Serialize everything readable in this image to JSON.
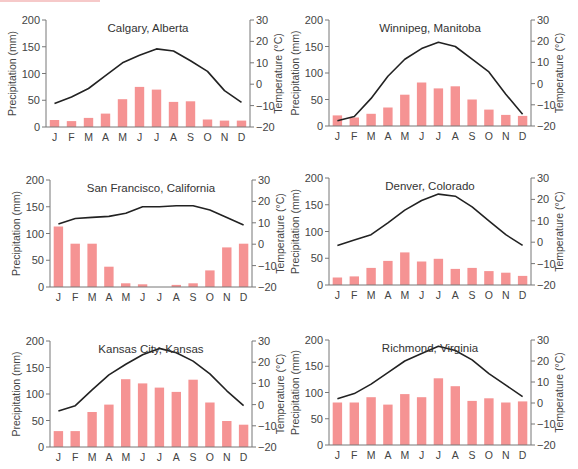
{
  "figure": {
    "left_axis_label": "Precipitation (mm)",
    "right_axis_label": "Temperature (°C)",
    "left_ticks": [
      "0",
      "50",
      "100",
      "150",
      "200"
    ],
    "right_ticks": [
      "-20",
      "-10",
      "0",
      "10",
      "20",
      "30"
    ],
    "months": [
      "J",
      "F",
      "M",
      "A",
      "M",
      "J",
      "J",
      "A",
      "S",
      "O",
      "N",
      "D"
    ],
    "bar_color": "#f59393",
    "line_color": "#222222",
    "axis_color": "#777777"
  },
  "chart_data": [
    {
      "type": "bar+line",
      "title": "Calgary, Alberta",
      "categories": [
        "J",
        "F",
        "M",
        "A",
        "M",
        "J",
        "J",
        "A",
        "S",
        "O",
        "N",
        "D"
      ],
      "series": [
        {
          "name": "Precipitation (mm)",
          "type": "bar",
          "axis": "left",
          "values": [
            13,
            11,
            17,
            25,
            52,
            75,
            70,
            47,
            48,
            14,
            12,
            12
          ]
        },
        {
          "name": "Temperature (°C)",
          "type": "line",
          "axis": "right",
          "values": [
            -9,
            -6,
            -2,
            4,
            10,
            13.5,
            16.5,
            15.5,
            11,
            6,
            -3,
            -8.5
          ]
        }
      ],
      "ylabel_left": "Precipitation (mm)",
      "ylim_left": [
        0,
        200
      ],
      "ylabel_right": "Temperature (°C)",
      "ylim_right": [
        -20,
        30
      ],
      "grid": false
    },
    {
      "type": "bar+line",
      "title": "Winnipeg, Manitoba",
      "categories": [
        "J",
        "F",
        "M",
        "A",
        "M",
        "J",
        "J",
        "A",
        "S",
        "O",
        "N",
        "D"
      ],
      "series": [
        {
          "name": "Precipitation (mm)",
          "type": "bar",
          "axis": "left",
          "values": [
            20,
            16,
            23,
            35,
            59,
            82,
            71,
            75,
            50,
            31,
            21,
            19
          ]
        },
        {
          "name": "Temperature (°C)",
          "type": "line",
          "axis": "right",
          "values": [
            -17.5,
            -15.5,
            -7,
            3.5,
            11.5,
            16.5,
            19.5,
            17.5,
            11.5,
            5.5,
            -5,
            -14.5
          ]
        }
      ],
      "ylabel_left": "Precipitation (mm)",
      "ylim_left": [
        0,
        200
      ],
      "ylabel_right": "Temperature (°C)",
      "ylim_right": [
        -20,
        30
      ],
      "grid": false
    },
    {
      "type": "bar+line",
      "title": "San Francisco, California",
      "categories": [
        "J",
        "F",
        "M",
        "A",
        "M",
        "J",
        "J",
        "A",
        "S",
        "O",
        "N",
        "D"
      ],
      "series": [
        {
          "name": "Precipitation (mm)",
          "type": "bar",
          "axis": "left",
          "values": [
            113,
            81,
            81,
            38,
            7,
            5,
            0,
            4,
            7,
            31,
            74,
            81
          ]
        },
        {
          "name": "Temperature (°C)",
          "type": "line",
          "axis": "right",
          "values": [
            9.5,
            12,
            12.5,
            13,
            14.5,
            17.5,
            17.5,
            18,
            18,
            16,
            12.5,
            9
          ]
        }
      ],
      "ylabel_left": "Precipitation (mm)",
      "ylim_left": [
        0,
        200
      ],
      "ylabel_right": "Temperature (°C)",
      "ylim_right": [
        -20,
        30
      ],
      "grid": false
    },
    {
      "type": "bar+line",
      "title": "Denver, Colorado",
      "categories": [
        "J",
        "F",
        "M",
        "A",
        "M",
        "J",
        "J",
        "A",
        "S",
        "O",
        "N",
        "D"
      ],
      "series": [
        {
          "name": "Precipitation (mm)",
          "type": "bar",
          "axis": "left",
          "values": [
            14,
            16,
            32,
            45,
            61,
            44,
            49,
            30,
            32,
            26,
            23,
            17
          ]
        },
        {
          "name": "Temperature (°C)",
          "type": "line",
          "axis": "right",
          "values": [
            -1.5,
            1,
            3.5,
            9,
            15,
            19.5,
            22.5,
            21.5,
            16.5,
            10,
            3.5,
            -1.5
          ]
        }
      ],
      "ylabel_left": "Precipitation (mm)",
      "ylim_left": [
        0,
        200
      ],
      "ylabel_right": "Temperature (°C)",
      "ylim_right": [
        -20,
        30
      ],
      "grid": false
    },
    {
      "type": "bar+line",
      "title": "Kansas City, Kansas",
      "categories": [
        "J",
        "F",
        "M",
        "A",
        "M",
        "J",
        "J",
        "A",
        "S",
        "O",
        "N",
        "D"
      ],
      "series": [
        {
          "name": "Precipitation (mm)",
          "type": "bar",
          "axis": "left",
          "values": [
            30,
            30,
            66,
            80,
            128,
            120,
            112,
            104,
            127,
            84,
            49,
            42
          ]
        },
        {
          "name": "Temperature (°C)",
          "type": "line",
          "axis": "right",
          "values": [
            -3,
            -0.5,
            7,
            14,
            19,
            23.5,
            26.5,
            24.5,
            20.5,
            14.5,
            6.5,
            -0.5
          ]
        }
      ],
      "ylabel_left": "Precipitation (mm)",
      "ylim_left": [
        0,
        200
      ],
      "ylabel_right": "Temperature (°C)",
      "ylim_right": [
        -20,
        30
      ],
      "grid": false
    },
    {
      "type": "bar+line",
      "title": "Richmond, Virginia",
      "categories": [
        "J",
        "F",
        "M",
        "A",
        "M",
        "J",
        "J",
        "A",
        "S",
        "O",
        "N",
        "D"
      ],
      "series": [
        {
          "name": "Precipitation (mm)",
          "type": "bar",
          "axis": "left",
          "values": [
            81,
            81,
            91,
            77,
            97,
            91,
            127,
            112,
            84,
            89,
            81,
            83
          ]
        },
        {
          "name": "Temperature (°C)",
          "type": "line",
          "axis": "right",
          "values": [
            2,
            4.5,
            9,
            14.5,
            20,
            23.5,
            27,
            25,
            20.5,
            14,
            8.5,
            3
          ]
        }
      ],
      "ylabel_left": "Precipitation (mm)",
      "ylim_left": [
        0,
        200
      ],
      "ylabel_right": "Temperature (°C)",
      "ylim_right": [
        -20,
        30
      ],
      "grid": false
    }
  ]
}
